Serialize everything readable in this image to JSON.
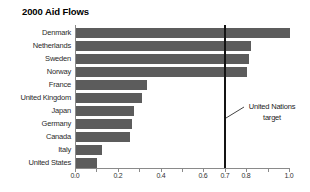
{
  "title": "2000 Aid Flows",
  "chart_data": {
    "type": "bar",
    "orientation": "horizontal",
    "title": "2000 Aid Flows",
    "xlabel": "",
    "ylabel": "",
    "xlim": [
      0.0,
      1.0
    ],
    "grid": false,
    "categories": [
      "Denmark",
      "Netherlands",
      "Sweden",
      "Norway",
      "France",
      "United Kingdom",
      "Japan",
      "Germany",
      "Canada",
      "Italy",
      "United States"
    ],
    "values": [
      1.0,
      0.82,
      0.81,
      0.8,
      0.33,
      0.31,
      0.27,
      0.26,
      0.25,
      0.12,
      0.1
    ],
    "bar_color": "#5c5c5c",
    "x_tick_labels": [
      {
        "value": 0.0,
        "label": "0.0"
      },
      {
        "value": 0.2,
        "label": "0.2"
      },
      {
        "value": 0.4,
        "label": "0.4"
      },
      {
        "value": 0.6,
        "label": "0.6"
      },
      {
        "value": 0.7,
        "label": "0.7"
      },
      {
        "value": 0.8,
        "label": "0.8"
      },
      {
        "value": 1.0,
        "label": "1.0"
      }
    ],
    "minor_tick_step": 0.1,
    "target_line": {
      "value": 0.7,
      "color": "#141414",
      "label_line1": "United Nations",
      "label_line2": "target"
    }
  }
}
